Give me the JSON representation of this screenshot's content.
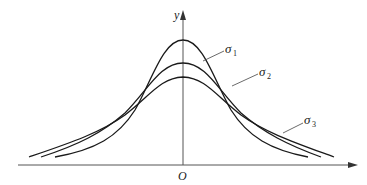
{
  "diagram": {
    "axes": {
      "x_label": "",
      "y_label": "y",
      "origin_label": "O"
    },
    "curves": [
      {
        "name": "sigma1",
        "symbol": "σ",
        "subscript": "1",
        "peak_height": "highest",
        "spread": "narrowest"
      },
      {
        "name": "sigma2",
        "symbol": "σ",
        "subscript": "2",
        "peak_height": "middle",
        "spread": "medium"
      },
      {
        "name": "sigma3",
        "symbol": "σ",
        "subscript": "3",
        "peak_height": "lowest",
        "spread": "widest"
      }
    ],
    "relation": "σ1 < σ2 < σ3",
    "colors": {
      "line": "#1a1a1a",
      "axis": "#555555"
    }
  }
}
